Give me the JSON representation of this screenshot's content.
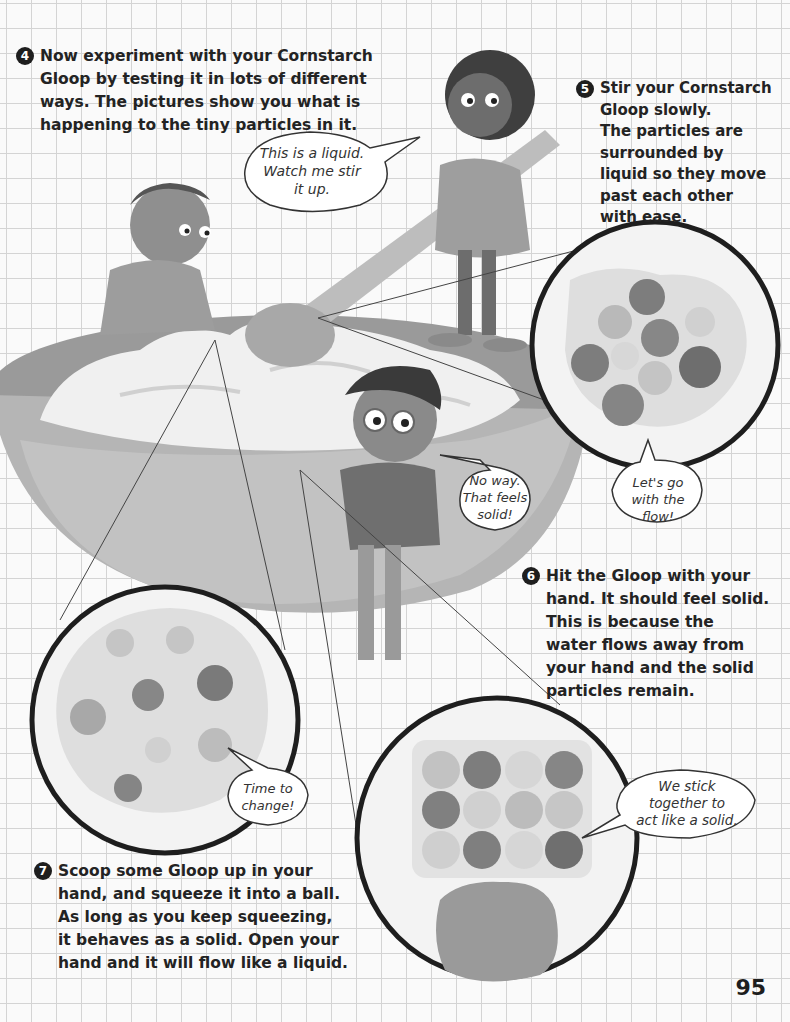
{
  "page": {
    "number": "95"
  },
  "colors": {
    "grid_line": "#d4d4d4",
    "background": "#fafafa",
    "text": "#232323",
    "bowl": "#a9a9a9",
    "gloop": "#f0f0f0",
    "lens_outline": "#1e1e1e"
  },
  "steps": [
    {
      "number": "4",
      "lines": [
        "Now experiment with your Cornstarch",
        "Gloop by testing it in lots of different",
        "ways. The pictures show you what is",
        "happening to the tiny particles in it."
      ]
    },
    {
      "number": "5",
      "lines": [
        "Stir your Cornstarch",
        "Gloop slowly.",
        "The particles are",
        "surrounded by",
        "liquid so they move",
        "past each other",
        "with ease."
      ]
    },
    {
      "number": "6",
      "lines": [
        "Hit the Gloop with your",
        "hand. It should feel solid.",
        "This is because the",
        "water flows away from",
        "your hand and the solid",
        "particles remain."
      ]
    },
    {
      "number": "7",
      "lines": [
        "Scoop some Gloop up in your",
        "hand, and squeeze it into a ball.",
        "As long as you keep squeezing,",
        "it behaves as a solid. Open your",
        "hand and it will flow like a liquid."
      ]
    }
  ],
  "speech_bubbles": [
    {
      "id": "liquid",
      "lines": [
        "This is a liquid.",
        "Watch me stir",
        "it up."
      ]
    },
    {
      "id": "solid",
      "lines": [
        "No way.",
        "That feels",
        "solid!"
      ]
    },
    {
      "id": "flow",
      "lines": [
        "Let's go",
        "with the",
        "flow!"
      ]
    },
    {
      "id": "change",
      "lines": [
        "Time to",
        "change!"
      ]
    },
    {
      "id": "stick",
      "lines": [
        "We stick",
        "together to",
        "act like a solid."
      ]
    }
  ],
  "illustrations": {
    "bowl": "large mixing bowl of cornstarch gloop",
    "kids": [
      "boy leaning on bowl",
      "girl stirring with spoon",
      "boy with glasses touching gloop"
    ],
    "lenses": [
      "stirring-particles-lens",
      "squeeze-particles-lens",
      "hit-particles-lens"
    ]
  }
}
